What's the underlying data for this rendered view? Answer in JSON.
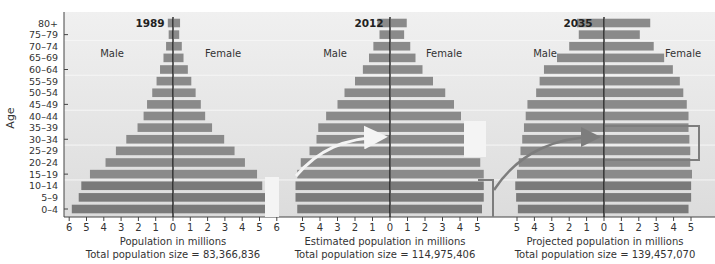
{
  "chart_data": {
    "type": "bar",
    "subtype": "population-pyramid",
    "ylabel": "Age",
    "categories": [
      "80+",
      "75–79",
      "70–74",
      "65–69",
      "60–64",
      "55–59",
      "50–54",
      "45–49",
      "40–44",
      "35–39",
      "30–34",
      "25–29",
      "20–24",
      "15–19",
      "10–14",
      "5–9",
      "0–4"
    ],
    "legend": {
      "left": "Male",
      "right": "Female"
    },
    "panels": [
      {
        "title": "1989",
        "xlabel": "Population in millions",
        "total_label": "Total population size = 83,366,836",
        "xticks_left": [
          6,
          5,
          4,
          3,
          2,
          1,
          0
        ],
        "xticks_right": [
          1,
          2,
          3,
          4,
          5,
          6
        ],
        "xlim": [
          -6,
          6
        ],
        "series": [
          {
            "name": "Male",
            "values": [
              0.3,
              0.25,
              0.4,
              0.55,
              0.75,
              0.95,
              1.2,
              1.5,
              1.7,
              2.05,
              2.7,
              3.3,
              3.9,
              4.8,
              5.3,
              5.45,
              5.85
            ]
          },
          {
            "name": "Female",
            "values": [
              0.35,
              0.3,
              0.45,
              0.55,
              0.8,
              1.0,
              1.25,
              1.55,
              1.8,
              2.2,
              2.9,
              3.5,
              4.1,
              4.8,
              5.1,
              5.3,
              5.5
            ]
          }
        ]
      },
      {
        "title": "2012",
        "xlabel": "Estimated population in millions",
        "total_label": "Total population size = 114,975,406",
        "xticks_left": [
          5,
          4,
          3,
          2,
          1,
          0
        ],
        "xticks_right": [
          1,
          2,
          3,
          4,
          5
        ],
        "xlim": [
          -5.5,
          5.5
        ],
        "series": [
          {
            "name": "Male",
            "values": [
              0.72,
              0.6,
              0.95,
              1.2,
              1.55,
              2.0,
              2.6,
              3.0,
              3.65,
              4.1,
              4.2,
              4.6,
              5.1,
              5.3,
              5.4,
              5.4,
              5.3
            ]
          },
          {
            "name": "Female",
            "values": [
              0.9,
              0.75,
              1.1,
              1.4,
              1.8,
              2.4,
              3.1,
              3.6,
              4.0,
              4.4,
              4.6,
              4.8,
              5.1,
              5.3,
              5.3,
              5.3,
              5.2
            ]
          }
        ]
      },
      {
        "title": "2035",
        "xlabel": "Projected population in millions",
        "total_label": "Total population size = 139,457,070",
        "xticks_left": [
          5,
          4,
          3,
          2,
          1,
          0
        ],
        "xticks_right": [
          1,
          2,
          3,
          4,
          5
        ],
        "xlim": [
          -5.5,
          5.5
        ],
        "series": [
          {
            "name": "Male",
            "values": [
              1.55,
              1.45,
              2.0,
              2.7,
              3.45,
              3.7,
              3.9,
              4.4,
              4.5,
              4.6,
              4.7,
              4.8,
              4.9,
              5.0,
              5.1,
              5.05,
              4.95
            ]
          },
          {
            "name": "Female",
            "values": [
              2.6,
              2.0,
              2.8,
              3.4,
              3.9,
              4.3,
              4.5,
              4.7,
              4.8,
              4.8,
              4.85,
              4.9,
              4.9,
              5.0,
              4.95,
              4.95,
              4.8
            ]
          }
        ]
      }
    ],
    "annotations": [
      "Highlighted cohort 0–14 in 1989 shifts to 20–34 in 2012 (arrow)",
      "Highlighted cohort 0–14 in 2012 shifts to 20–34 in 2035 (arrow)"
    ]
  },
  "colors": {
    "bar": "#8a8a8a",
    "bar_dark": "#7a7a7a",
    "background": "#e4e4e4",
    "axis": "#444444",
    "center_line": "#111111",
    "highlight_box": "#7d7d7d",
    "arrow_light": "#f2f2f2",
    "arrow_dark": "#7d7d7d"
  },
  "labels": {
    "age": "Age",
    "male": "Male",
    "female": "Female"
  }
}
